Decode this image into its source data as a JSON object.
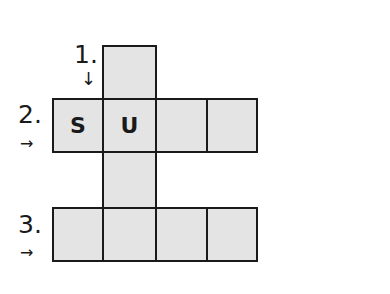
{
  "puzzle": {
    "clues": [
      {
        "number": "1.",
        "direction": "down"
      },
      {
        "number": "2.",
        "direction": "across"
      },
      {
        "number": "3.",
        "direction": "across"
      }
    ],
    "cells": {
      "c1r0": "",
      "c0r1": "S",
      "c1r1": "U",
      "c2r1": "",
      "c3r1": "",
      "c1r2": "",
      "c0r3": "",
      "c1r3": "",
      "c2r3": "",
      "c3r3": ""
    },
    "icons": {
      "down_arrow": "↓",
      "right_arrow": "→"
    },
    "colors": {
      "cell_fill": "#e4e4e4",
      "border": "#1a1a1a"
    }
  }
}
